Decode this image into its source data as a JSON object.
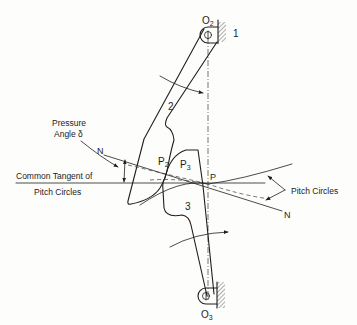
{
  "figure": {
    "labels": {
      "pivot_top": "O",
      "pivot_top_sub": "2",
      "pivot_bottom": "O",
      "pivot_bottom_sub": "3",
      "frame": "1",
      "link_upper": "2",
      "link_lower": "3",
      "contact_p2": "P",
      "contact_p2_sub": "2",
      "contact_p3": "P",
      "contact_p3_sub": "3",
      "pitch_point": "P",
      "normal_start": "N",
      "normal_end": "N",
      "pressure_angle_line1": "Pressure",
      "pressure_angle_line2": "Angle δ",
      "common_tangent_line1": "Common Tangent of",
      "common_tangent_line2": "Pitch Circles",
      "pitch_circles": "Pitch Circles"
    },
    "colors": {
      "ink": "#1e1e1e",
      "background": "#fdfdfb"
    }
  }
}
